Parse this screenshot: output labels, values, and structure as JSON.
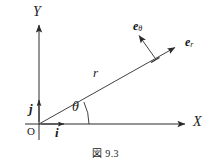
{
  "figure": {
    "caption": "図 9.3",
    "stroke_color": "#2b2b2b",
    "text_color": "#1a1a1a",
    "background": "#ffffff"
  },
  "axes": {
    "y_label": "Y",
    "x_label": "X",
    "origin_label": "O"
  },
  "vectors": {
    "radial_label": "r",
    "basis_i_label": "i",
    "basis_j_label": "j",
    "e_theta_label": "e",
    "e_theta_sub": "θ",
    "e_r_label": "e",
    "e_r_sub": "r"
  },
  "angle": {
    "label": "θ"
  },
  "geometry": {
    "origin_x": 39,
    "origin_y": 124,
    "x_axis_start": 25,
    "x_axis_end": 187,
    "y_axis_top": 23,
    "y_axis_bottom": 140,
    "r_tip_x": 177,
    "r_tip_y": 46,
    "e_theta_base_x": 155,
    "e_theta_base_y": 58,
    "e_theta_tip_x": 137,
    "e_theta_tip_y": 33,
    "theta_degrees": 26
  }
}
